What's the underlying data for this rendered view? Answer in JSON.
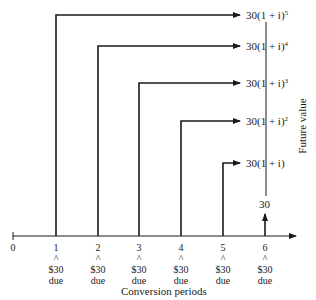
{
  "diagram": {
    "type": "cash-flow timeline",
    "x_axis_title": "Conversion periods",
    "y_axis_title": "Future value",
    "origin_label": "0",
    "periods": [
      {
        "label": "1",
        "marker": "^",
        "amount": "$30",
        "note": "due",
        "future_value": "30(1 + i)",
        "exponent": "5"
      },
      {
        "label": "2",
        "marker": "^",
        "amount": "$30",
        "note": "due",
        "future_value": "30(1 + i)",
        "exponent": "4"
      },
      {
        "label": "3",
        "marker": "^",
        "amount": "$30",
        "note": "due",
        "future_value": "30(1 + i)",
        "exponent": "3"
      },
      {
        "label": "4",
        "marker": "^",
        "amount": "$30",
        "note": "due",
        "future_value": "30(1 + i)",
        "exponent": "2"
      },
      {
        "label": "5",
        "marker": "^",
        "amount": "$30",
        "note": "due",
        "future_value": "30(1 + i)",
        "exponent": ""
      },
      {
        "label": "6",
        "marker": "^",
        "amount": "$30",
        "note": "due",
        "future_value": "30",
        "exponent": ""
      }
    ],
    "colors": {
      "line": "#1a1a1a",
      "background": "#ffffff"
    }
  }
}
